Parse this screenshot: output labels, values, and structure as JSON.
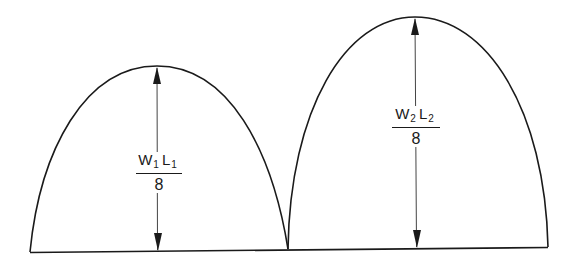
{
  "diagram": {
    "type": "moment-diagram",
    "spans": [
      {
        "id": "span-1",
        "label": {
          "load": "W",
          "load_sub": "1",
          "length": "L",
          "length_sub": "1",
          "denominator": "8"
        },
        "peak_expression": "W1 L1 / 8"
      },
      {
        "id": "span-2",
        "label": {
          "load": "W",
          "load_sub": "2",
          "length": "L",
          "length_sub": "2",
          "denominator": "8"
        },
        "peak_expression": "W2 L2 / 8"
      }
    ],
    "colors": {
      "line": "#1a1a1a",
      "dimension_line": "#444444",
      "background": "#ffffff"
    }
  }
}
